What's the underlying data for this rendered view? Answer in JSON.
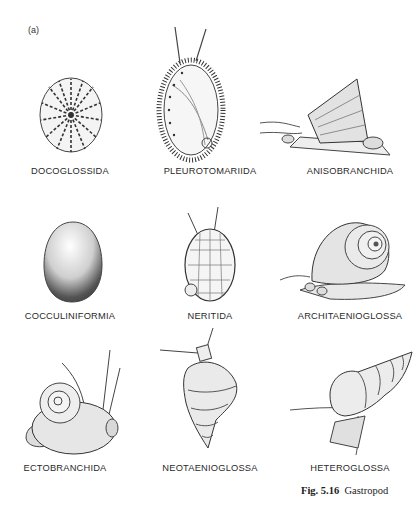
{
  "figure": {
    "panel_label": "(a)",
    "caption_number": "Fig. 5.16",
    "caption_text": "Gastropod",
    "taxa": [
      {
        "name": "DOCOGLOSSIDA",
        "illustration": "limpet-radial-ribs"
      },
      {
        "name": "PLEUROTOMARIIDA",
        "illustration": "spiny-oval-shell-with-tentacles"
      },
      {
        "name": "ANISOBRANCHIDA",
        "illustration": "conical-shell-on-foot"
      },
      {
        "name": "COCCULINIFORMIA",
        "illustration": "egg-shaped-shell"
      },
      {
        "name": "NERITIDA",
        "illustration": "reticulated-oval-shell"
      },
      {
        "name": "ARCHITAENIOGLOSSA",
        "illustration": "coiled-snail-with-foot"
      },
      {
        "name": "ECTOBRANCHIDA",
        "illustration": "planispiral-snail-with-tentacles"
      },
      {
        "name": "NEOTAENIOGLOSSA",
        "illustration": "turreted-shell-with-operculum"
      },
      {
        "name": "HETEROGLOSSA",
        "illustration": "high-spired-shell"
      }
    ]
  }
}
